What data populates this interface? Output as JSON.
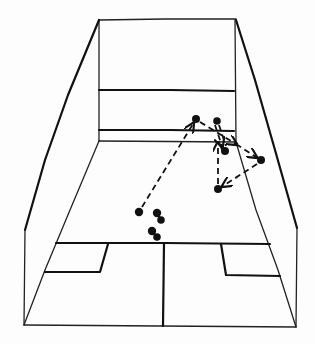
{
  "diagram": {
    "colors": {
      "ink": "#111111",
      "paper": "#fdfdfd"
    },
    "court": {
      "front_wall": {
        "top_left": [
          99,
          20
        ],
        "top_right": [
          236,
          19
        ],
        "bottom_left": [
          99,
          140
        ],
        "bottom_right": [
          236,
          141
        ]
      },
      "service_line_y": 90,
      "tin_top_y": 130,
      "floor_back_left": [
        24,
        325
      ],
      "floor_back_right": [
        296,
        327
      ],
      "short_line_y": 243,
      "half_court_x": 164
    },
    "ball_positions": [
      {
        "id": "p1",
        "x": 139,
        "y": 212
      },
      {
        "id": "p2",
        "x": 196,
        "y": 119
      },
      {
        "id": "p3",
        "x": 217,
        "y": 121
      },
      {
        "id": "p4",
        "x": 225,
        "y": 151
      },
      {
        "id": "p5",
        "x": 261,
        "y": 160
      },
      {
        "id": "p6",
        "x": 218,
        "y": 189
      }
    ],
    "player_marks": [
      {
        "id": "feet-1",
        "x": 158,
        "y": 216
      },
      {
        "id": "feet-2",
        "x": 153,
        "y": 234
      }
    ],
    "trajectories": [
      {
        "from": "p1",
        "to": "p2"
      },
      {
        "from": "p2",
        "to": "p5",
        "via": [
          236,
          144
        ]
      },
      {
        "from": "p3",
        "to": "p4"
      },
      {
        "from": "p5",
        "to": "p6"
      },
      {
        "from": "p6",
        "to": "p3"
      }
    ]
  }
}
